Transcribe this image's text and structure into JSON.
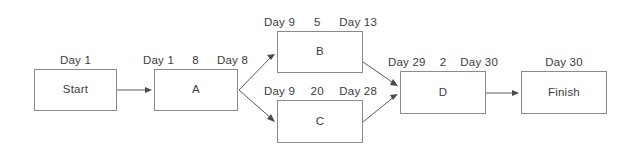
{
  "diagram": {
    "type": "project-network-diagram",
    "stroke_color": "#8a8a8a",
    "edge_color": "#5a5a5a",
    "text_color": "#3c3c3c",
    "background_color": "#ffffff",
    "nodes": [
      {
        "id": "start",
        "label": "Start",
        "header": {
          "start": "Day 1",
          "duration": "",
          "finish": ""
        },
        "header_layout": "center",
        "x": 34,
        "y": 69,
        "w": 83,
        "h": 42
      },
      {
        "id": "a",
        "label": "A",
        "header": {
          "start": "Day 1",
          "duration": "8",
          "finish": "Day 8"
        },
        "header_layout": "spread",
        "x": 154,
        "y": 69,
        "w": 84,
        "h": 42
      },
      {
        "id": "b",
        "label": "B",
        "header": {
          "start": "Day 9",
          "duration": "5",
          "finish": "Day 13"
        },
        "header_layout": "spread",
        "x": 277,
        "y": 31,
        "w": 86,
        "h": 42
      },
      {
        "id": "c",
        "label": "C",
        "header": {
          "start": "Day 9",
          "duration": "20",
          "finish": "Day 28"
        },
        "header_layout": "spread",
        "x": 277,
        "y": 100,
        "w": 86,
        "h": 43
      },
      {
        "id": "d",
        "label": "D",
        "header": {
          "start": "Day 29",
          "duration": "2",
          "finish": "Day 30"
        },
        "header_layout": "spread",
        "x": 400,
        "y": 71,
        "w": 86,
        "h": 43
      },
      {
        "id": "finish",
        "label": "Finish",
        "header": {
          "start": "Day 30",
          "duration": "",
          "finish": ""
        },
        "header_layout": "center",
        "x": 521,
        "y": 71,
        "w": 86,
        "h": 43
      }
    ],
    "edges": [
      {
        "id": "start-to-a",
        "from": "start",
        "to": "a",
        "x1": 117,
        "y1": 90,
        "x2": 152,
        "y2": 90
      },
      {
        "id": "a-to-b",
        "from": "a",
        "to": "b",
        "x1": 239,
        "y1": 90,
        "x2": 275,
        "y2": 54
      },
      {
        "id": "a-to-c",
        "from": "a",
        "to": "c",
        "x1": 239,
        "y1": 90,
        "x2": 275,
        "y2": 122
      },
      {
        "id": "b-to-d",
        "from": "b",
        "to": "d",
        "x1": 363,
        "y1": 62,
        "x2": 398,
        "y2": 86
      },
      {
        "id": "c-to-d",
        "from": "c",
        "to": "d",
        "x1": 363,
        "y1": 122,
        "x2": 398,
        "y2": 94
      },
      {
        "id": "d-to-finish",
        "from": "d",
        "to": "finish",
        "x1": 486,
        "y1": 93,
        "x2": 519,
        "y2": 93
      }
    ]
  }
}
